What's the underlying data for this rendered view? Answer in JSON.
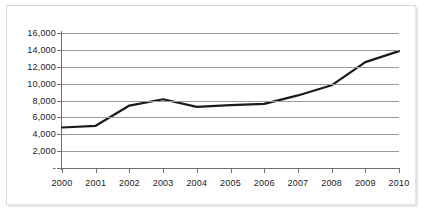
{
  "chart_data": {
    "type": "line",
    "title": "",
    "subtitle": "",
    "xlabel": "",
    "ylabel": "",
    "categories": [
      "2000",
      "2001",
      "2002",
      "2003",
      "2004",
      "2005",
      "2006",
      "2007",
      "2008",
      "2009",
      "2010"
    ],
    "x": [
      2000,
      2001,
      2002,
      2003,
      2004,
      2005,
      2006,
      2007,
      2008,
      2009,
      2010
    ],
    "series": [
      {
        "name": "",
        "values": [
          4800,
          5000,
          7400,
          8150,
          7250,
          7450,
          7600,
          8600,
          9800,
          12550,
          13850
        ]
      }
    ],
    "ylim": [
      0,
      16000
    ],
    "yticks": [
      0,
      2000,
      4000,
      6000,
      8000,
      10000,
      12000,
      14000,
      16000
    ],
    "ytick_labels": [
      "-",
      "2,000",
      "4,000",
      "6,000",
      "8,000",
      "10,000",
      "12,000",
      "14,000",
      "16,000"
    ],
    "xtick_labels": [
      "2000",
      "2001",
      "2002",
      "2003",
      "2004",
      "2005",
      "2006",
      "2007",
      "2008",
      "2009",
      "2010"
    ],
    "grid": true,
    "grid_axis": "y",
    "legend": false,
    "legend_position": "none",
    "annotations": [],
    "colors": {
      "line": "#1a1a1a",
      "gridline": "#9a9a9a",
      "axis": "#6e6e6e",
      "background": "#ffffff",
      "frame_border": "#d9d9d9",
      "frame_shadow": "#e6e6e6",
      "tick_text": "#1a1a1a"
    }
  }
}
